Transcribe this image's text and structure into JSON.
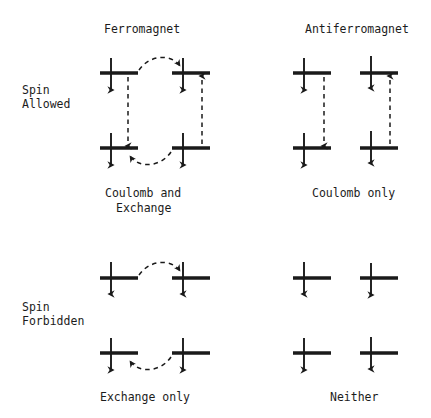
{
  "page": {
    "clipped_running_head": "··· ·· ···· ··· ··· ·········· ·· ··· ····· ··· ··· ·····",
    "background_color": "#ffffff",
    "ink_color": "#1a1a1a"
  },
  "column_headers": [
    {
      "id": "ferromagnet",
      "label": "Ferromagnet"
    },
    {
      "id": "antiferromagnet",
      "label": "Antiferromagnet"
    }
  ],
  "row_headers": [
    {
      "id": "spin-allowed",
      "line1": "Spin",
      "line2": "Allowed"
    },
    {
      "id": "spin-forbidden",
      "line1": "Spin",
      "line2": "Forbidden"
    }
  ],
  "captions": [
    {
      "id": "ferro-allowed",
      "line1": "Coulomb and",
      "line2": "Exchange"
    },
    {
      "id": "antiferro-allowed",
      "line1": "Coulomb only",
      "line2": ""
    },
    {
      "id": "ferro-forbidden",
      "line1": "Exchange only",
      "line2": ""
    },
    {
      "id": "antiferro-forbidden",
      "line1": "Neither",
      "line2": ""
    }
  ],
  "panels": [
    {
      "id": "ferromagnet-spin-allowed",
      "column": "Ferromagnet",
      "row": "Spin Allowed",
      "caption": "Coulomb and Exchange",
      "sites": [
        {
          "id": "upper-left",
          "spin": "up",
          "level": "upper",
          "site": "left"
        },
        {
          "id": "upper-right",
          "spin": "up",
          "level": "upper",
          "site": "right"
        },
        {
          "id": "lower-left",
          "spin": "up",
          "level": "lower",
          "site": "left"
        },
        {
          "id": "lower-right",
          "spin": "up",
          "level": "lower",
          "site": "right"
        }
      ],
      "transitions": [
        {
          "id": "left-vertical-down",
          "style": "dashed-straight",
          "direction": "down",
          "from": "upper-left",
          "to": "lower-left"
        },
        {
          "id": "right-vertical-up",
          "style": "dashed-straight",
          "direction": "up",
          "from": "lower-right",
          "to": "upper-right"
        },
        {
          "id": "top-curve-rightward",
          "style": "dashed-curve",
          "direction": "right",
          "from": "upper-left",
          "to": "upper-right"
        },
        {
          "id": "bottom-curve-leftward",
          "style": "dashed-curve",
          "direction": "left",
          "from": "lower-right",
          "to": "lower-left"
        }
      ]
    },
    {
      "id": "antiferromagnet-spin-allowed",
      "column": "Antiferromagnet",
      "row": "Spin Allowed",
      "caption": "Coulomb only",
      "sites": [
        {
          "id": "upper-left",
          "spin": "up",
          "level": "upper",
          "site": "left"
        },
        {
          "id": "upper-right",
          "spin": "down",
          "level": "upper",
          "site": "right"
        },
        {
          "id": "lower-left",
          "spin": "up",
          "level": "lower",
          "site": "left"
        },
        {
          "id": "lower-right",
          "spin": "down",
          "level": "lower",
          "site": "right"
        }
      ],
      "transitions": [
        {
          "id": "left-vertical-down",
          "style": "dashed-straight",
          "direction": "down",
          "from": "upper-left",
          "to": "lower-left"
        },
        {
          "id": "right-vertical-up",
          "style": "dashed-straight",
          "direction": "up",
          "from": "lower-right",
          "to": "upper-right"
        }
      ]
    },
    {
      "id": "ferromagnet-spin-forbidden",
      "column": "Ferromagnet",
      "row": "Spin Forbidden",
      "caption": "Exchange only",
      "sites": [
        {
          "id": "upper-left",
          "spin": "down",
          "level": "upper",
          "site": "left"
        },
        {
          "id": "upper-right",
          "spin": "down",
          "level": "upper",
          "site": "right"
        },
        {
          "id": "lower-left",
          "spin": "up",
          "level": "lower",
          "site": "left"
        },
        {
          "id": "lower-right",
          "spin": "up",
          "level": "lower",
          "site": "right"
        }
      ],
      "transitions": [
        {
          "id": "top-curve-rightward",
          "style": "dashed-curve",
          "direction": "right",
          "from": "upper-left",
          "to": "upper-right"
        },
        {
          "id": "bottom-curve-leftward",
          "style": "dashed-curve",
          "direction": "left",
          "from": "lower-right",
          "to": "lower-left"
        }
      ]
    },
    {
      "id": "antiferromagnet-spin-forbidden",
      "column": "Antiferromagnet",
      "row": "Spin Forbidden",
      "caption": "Neither",
      "sites": [
        {
          "id": "upper-left",
          "spin": "down",
          "level": "upper",
          "site": "left"
        },
        {
          "id": "upper-right",
          "spin": "up",
          "level": "upper",
          "site": "right"
        },
        {
          "id": "lower-left",
          "spin": "up",
          "level": "lower",
          "site": "left"
        },
        {
          "id": "lower-right",
          "spin": "down",
          "level": "lower",
          "site": "right"
        }
      ],
      "transitions": []
    }
  ]
}
